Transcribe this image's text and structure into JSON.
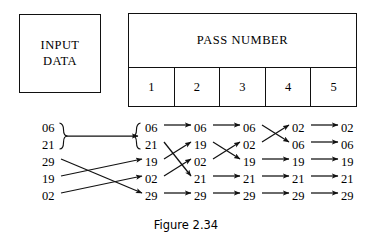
{
  "figure": {
    "caption": "Figure 2.34",
    "input_box": {
      "line1": "INPUT",
      "line2": "DATA"
    },
    "table": {
      "header": "PASS NUMBER",
      "columns": [
        "1",
        "2",
        "3",
        "4",
        "5"
      ]
    },
    "colors": {
      "ink": "#111111",
      "paper": "#ffffff"
    }
  },
  "chart_data": {
    "type": "diagram",
    "title": "Figure 2.34",
    "column_labels": [
      "INPUT DATA",
      "1",
      "2",
      "3",
      "4",
      "5"
    ],
    "columns": [
      {
        "name": "input",
        "values": [
          "06",
          "21",
          "29",
          "19",
          "02"
        ]
      },
      {
        "name": "pass1",
        "values": [
          "06",
          "21",
          "19",
          "02",
          "29"
        ]
      },
      {
        "name": "pass2",
        "values": [
          "06",
          "19",
          "02",
          "21",
          "29"
        ]
      },
      {
        "name": "pass3",
        "values": [
          "06",
          "02",
          "19",
          "21",
          "29"
        ]
      },
      {
        "name": "pass4",
        "values": [
          "02",
          "06",
          "19",
          "21",
          "29"
        ]
      },
      {
        "name": "pass5",
        "values": [
          "02",
          "06",
          "19",
          "21",
          "29"
        ]
      }
    ],
    "transitions": [
      {
        "from_column": "input",
        "to_column": "pass1",
        "braced": true,
        "mappings": [
          {
            "from_row": 1,
            "to_row": 1,
            "value": "06"
          },
          {
            "from_row": 2,
            "to_row": 2,
            "value": "21"
          },
          {
            "from_row": 3,
            "to_row": 5,
            "value": "29"
          },
          {
            "from_row": 4,
            "to_row": 3,
            "value": "19"
          },
          {
            "from_row": 5,
            "to_row": 4,
            "value": "02"
          }
        ]
      },
      {
        "from_column": "pass1",
        "to_column": "pass2",
        "braced": false,
        "mappings": [
          {
            "from_row": 1,
            "to_row": 1,
            "value": "06"
          },
          {
            "from_row": 2,
            "to_row": 4,
            "value": "21"
          },
          {
            "from_row": 3,
            "to_row": 2,
            "value": "19"
          },
          {
            "from_row": 4,
            "to_row": 3,
            "value": "02"
          },
          {
            "from_row": 5,
            "to_row": 5,
            "value": "29"
          }
        ]
      },
      {
        "from_column": "pass2",
        "to_column": "pass3",
        "braced": false,
        "mappings": [
          {
            "from_row": 1,
            "to_row": 1,
            "value": "06"
          },
          {
            "from_row": 2,
            "to_row": 3,
            "value": "19"
          },
          {
            "from_row": 3,
            "to_row": 2,
            "value": "02"
          },
          {
            "from_row": 4,
            "to_row": 4,
            "value": "21"
          },
          {
            "from_row": 5,
            "to_row": 5,
            "value": "29"
          }
        ]
      },
      {
        "from_column": "pass3",
        "to_column": "pass4",
        "braced": false,
        "mappings": [
          {
            "from_row": 1,
            "to_row": 2,
            "value": "06"
          },
          {
            "from_row": 2,
            "to_row": 1,
            "value": "02"
          },
          {
            "from_row": 3,
            "to_row": 3,
            "value": "19"
          },
          {
            "from_row": 4,
            "to_row": 4,
            "value": "21"
          },
          {
            "from_row": 5,
            "to_row": 5,
            "value": "29"
          }
        ]
      },
      {
        "from_column": "pass4",
        "to_column": "pass5",
        "braced": false,
        "mappings": [
          {
            "from_row": 1,
            "to_row": 1,
            "value": "02"
          },
          {
            "from_row": 2,
            "to_row": 2,
            "value": "06"
          },
          {
            "from_row": 3,
            "to_row": 3,
            "value": "19"
          },
          {
            "from_row": 4,
            "to_row": 4,
            "value": "21"
          },
          {
            "from_row": 5,
            "to_row": 5,
            "value": "29"
          }
        ]
      }
    ]
  }
}
